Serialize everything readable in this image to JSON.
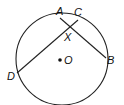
{
  "diagram": {
    "type": "circle-with-intersecting-chords",
    "circle": {
      "center": "O"
    },
    "points": {
      "A": {
        "label": "A"
      },
      "B": {
        "label": "B"
      },
      "C": {
        "label": "C"
      },
      "D": {
        "label": "D"
      },
      "X": {
        "label": "X"
      },
      "O": {
        "label": "O"
      }
    },
    "chords": [
      {
        "from": "A",
        "to": "B"
      },
      {
        "from": "C",
        "to": "D"
      }
    ],
    "intersection": "X"
  }
}
